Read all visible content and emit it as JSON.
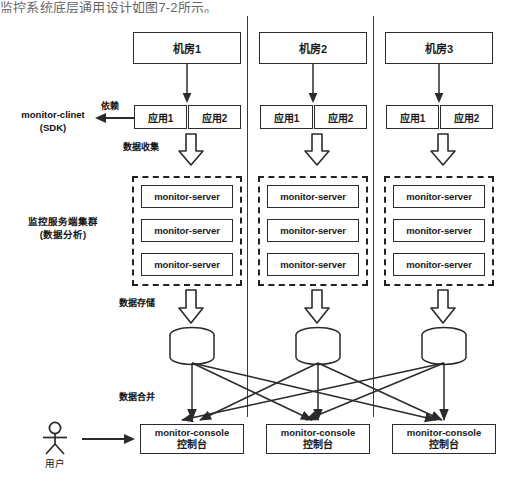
{
  "caption": "监控系统底层通用设计如图7-2所示。",
  "diagram": {
    "title_hidden": "",
    "side_labels": {
      "client": "monitor-clinet",
      "client_sub": "(SDK)",
      "cluster": "监控服务端集群",
      "cluster_sub": "(数据分析)",
      "user": "用户"
    },
    "flow_labels": {
      "dependency": "依赖",
      "data_collection": "数据收集",
      "data_storage": "数据存储",
      "data_merge": "数据合并"
    },
    "columns": [
      {
        "datacenter": "机房1",
        "apps": [
          "应用1",
          "应用2"
        ],
        "servers": [
          "monitor-server",
          "monitor-server",
          "monitor-server"
        ],
        "console": {
          "name": "monitor-console",
          "cn": "控制台"
        }
      },
      {
        "datacenter": "机房2",
        "apps": [
          "应用1",
          "应用2"
        ],
        "servers": [
          "monitor-server",
          "monitor-server",
          "monitor-server"
        ],
        "console": {
          "name": "monitor-console",
          "cn": "控制台"
        }
      },
      {
        "datacenter": "机房3",
        "apps": [
          "应用1",
          "应用2"
        ],
        "servers": [
          "monitor-server",
          "monitor-server",
          "monitor-server"
        ],
        "console": {
          "name": "monitor-console",
          "cn": "控制台"
        }
      }
    ],
    "colors": {
      "stroke": "#2b2b2b",
      "dashed": "#222222",
      "background": "#ffffff",
      "text": "#111111"
    }
  }
}
